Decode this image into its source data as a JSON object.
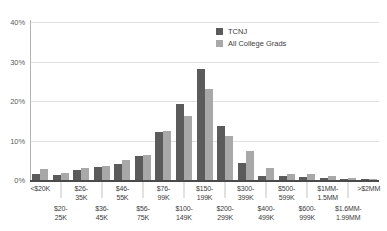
{
  "chart_data": {
    "type": "bar",
    "title": "",
    "subtitle": "",
    "xlabel": "",
    "ylabel": "",
    "ylim": [
      0,
      40
    ],
    "yticks": [
      0,
      10,
      20,
      30,
      40
    ],
    "ytick_labels": [
      "0%",
      "10%",
      "20%",
      "30%",
      "40%"
    ],
    "grid": true,
    "legend_position": "top-right",
    "value_unit": "percent",
    "categories": [
      "<$20K",
      "$20-25K",
      "$26-35K",
      "$36-45K",
      "$46-55K",
      "$56-75K",
      "$76-99K",
      "$100-149K",
      "$150-199K",
      "$200-299K",
      "$300-399K",
      "$400-499K",
      "$500-599K",
      "$600-999K",
      "$1MM-1.5MM",
      "$1.6MM-1.99MM",
      ">$2MM"
    ],
    "series": [
      {
        "name": "TCNJ",
        "color": "#5b5b5b",
        "values": [
          1.5,
          1.2,
          2.5,
          3.2,
          4.0,
          6.2,
          12.2,
          19.2,
          28.0,
          13.6,
          4.2,
          1.1,
          1.0,
          0.8,
          0.5,
          0.3,
          0.2
        ]
      },
      {
        "name": "All College Grads",
        "color": "#a8a8a8",
        "values": [
          2.8,
          1.7,
          3.0,
          3.6,
          5.0,
          6.3,
          12.5,
          16.2,
          23.0,
          11.2,
          7.4,
          3.0,
          1.6,
          1.4,
          0.9,
          0.5,
          0.3
        ]
      }
    ]
  },
  "legend": {
    "items": [
      {
        "label": "TCNJ"
      },
      {
        "label": "All College Grads"
      }
    ]
  },
  "axis": {
    "y_ticks": [
      "0%",
      "10%",
      "20%",
      "30%",
      "40%"
    ]
  }
}
